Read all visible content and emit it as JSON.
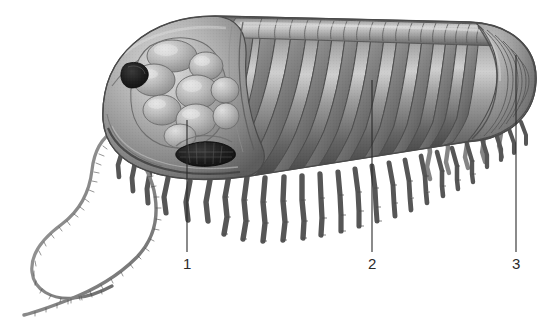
{
  "figure": {
    "type": "scientific-illustration",
    "view": "lateral-oblique",
    "background_color": "#ffffff",
    "ink_color": "#2b2b2b",
    "palette": {
      "body_mid": "#8f8f8f",
      "body_highlight": "#c8c8c8",
      "body_shadow": "#4d4d4d",
      "body_deep_shadow": "#333333",
      "eye_dark": "#1c1c1c",
      "outline": "#5a5a5a",
      "leader_line": "#2b2b2b"
    }
  },
  "callouts": [
    {
      "label": "1",
      "part": "glabella",
      "line": {
        "x": 187,
        "y1": 120,
        "y2": 252
      },
      "label_pos": {
        "x": 183,
        "y": 256
      }
    },
    {
      "label": "2",
      "part": "thorax-axial-lobe",
      "line": {
        "x": 372,
        "y1": 80,
        "y2": 252
      },
      "label_pos": {
        "x": 368,
        "y": 256
      }
    },
    {
      "label": "3",
      "part": "pygidium",
      "line": {
        "x": 516,
        "y1": 55,
        "y2": 252
      },
      "label_pos": {
        "x": 512,
        "y": 256
      }
    }
  ],
  "anatomy": {
    "cephalon": "cephalon",
    "glabella": "glabella",
    "eyes": "compound-eyes",
    "thorax": "thorax",
    "axial_lobe": "axial-lobe",
    "pleurae": "pleural-lobes",
    "pygidium": "pygidium",
    "antennae": "antennae",
    "legs": "biramous-legs"
  },
  "counts": {
    "thoracic_segments": 22,
    "legs_visible": 21,
    "antennae": 2,
    "eyes_visible": 2
  }
}
